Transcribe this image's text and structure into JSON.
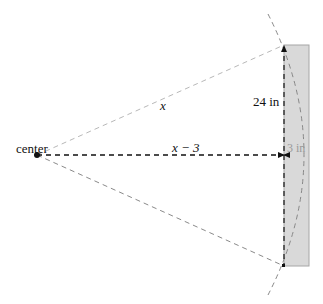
{
  "diagram": {
    "labels": {
      "center": "center",
      "hypotenuse": "x",
      "horizontal": "x − 3",
      "half_height": "24 in",
      "thickness": "3 in"
    },
    "colors": {
      "rect_fill": "#d9d9d9",
      "rect_stroke": "#a6a6a6",
      "dashed_black": "#111111",
      "dashed_gray": "#b0b0b0",
      "arc": "#888888"
    }
  }
}
